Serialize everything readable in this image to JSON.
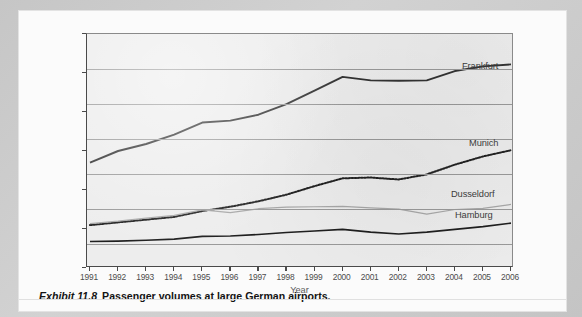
{
  "caption": {
    "exhibit_label": "Exhibit 11.8",
    "text": "Passenger volumes at large German airports."
  },
  "axes": {
    "y_title": "Number of passengers (1000s)",
    "x_title": "Year",
    "y_ticks": [
      "0",
      "10,000",
      "20,000",
      "30,000",
      "40,000",
      "50,000",
      "60,000"
    ],
    "x_ticks": [
      "1991",
      "1992",
      "1993",
      "1994",
      "1995",
      "1996",
      "1997",
      "1998",
      "1999",
      "2000",
      "2001",
      "2002",
      "2003",
      "2004",
      "2005",
      "2006"
    ]
  },
  "series_labels": {
    "frankfurt": "Frankfurt",
    "munich": "Munich",
    "dusseldorf": "Dusseldorf",
    "hamburg": "Hamburg"
  },
  "colors": {
    "frankfurt": "#333333",
    "munich": "#222222",
    "dusseldorf": "#a8a8a8",
    "hamburg": "#1f1f1f",
    "gridline": "#9a9a9a",
    "plot_background": "#ededed",
    "page_background": "#c9c9c9"
  },
  "chart_data": {
    "type": "line",
    "title": "Passenger volumes at large German airports",
    "xlabel": "Year",
    "ylabel": "Number of passengers (1000s)",
    "x": [
      1991,
      1992,
      1993,
      1994,
      1995,
      1996,
      1997,
      1998,
      1999,
      2000,
      2001,
      2002,
      2003,
      2004,
      2005,
      2006
    ],
    "xlim": [
      1991,
      2006
    ],
    "ylim": [
      0,
      60000
    ],
    "ytick_values": [
      0,
      10000,
      20000,
      30000,
      40000,
      50000,
      60000
    ],
    "grid": "horizontal",
    "legend": "inline-right-labels",
    "series": [
      {
        "name": "Frankfurt",
        "style": "solid-thick",
        "color": "#333333",
        "values": [
          27000,
          30000,
          31800,
          34200,
          37300,
          37800,
          39300,
          42000,
          45500,
          49000,
          48100,
          48000,
          48100,
          50500,
          51700,
          52200
        ]
      },
      {
        "name": "Munich",
        "style": "dotted",
        "color": "#222222",
        "values": [
          11000,
          11700,
          12400,
          13100,
          14600,
          15700,
          17100,
          18800,
          21000,
          23000,
          23200,
          22700,
          24000,
          26500,
          28600,
          30200
        ]
      },
      {
        "name": "Dusseldorf",
        "style": "solid-thin-gray",
        "color": "#a8a8a8",
        "values": [
          11400,
          12000,
          12800,
          13500,
          14900,
          14200,
          15200,
          15600,
          15700,
          15800,
          15400,
          15100,
          13800,
          15000,
          15300,
          16300
        ]
      },
      {
        "name": "Hamburg",
        "style": "solid-thin-dark",
        "color": "#1f1f1f",
        "values": [
          6800,
          6900,
          7100,
          7400,
          8100,
          8200,
          8600,
          9100,
          9500,
          9900,
          9200,
          8700,
          9200,
          9900,
          10600,
          11500
        ]
      }
    ]
  }
}
